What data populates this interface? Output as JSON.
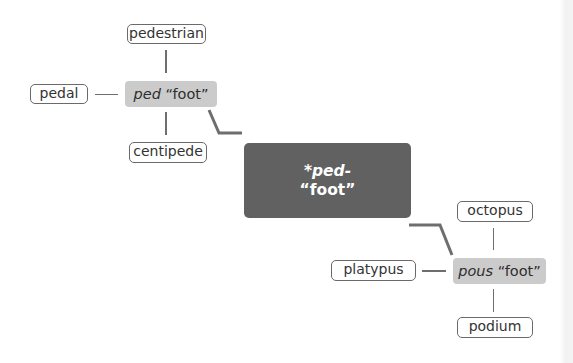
{
  "diagram": {
    "type": "word-family-tree",
    "core": {
      "root": "*ped-",
      "gloss": "“foot”"
    },
    "branches": [
      {
        "root": "ped",
        "gloss": "“foot”",
        "words": {
          "top": "pedestrian",
          "left": "pedal",
          "bottom": "centipede"
        }
      },
      {
        "root": "pous",
        "gloss": "“foot”",
        "words": {
          "top": "octopus",
          "left": "platypus",
          "bottom": "podium"
        }
      }
    ],
    "colors": {
      "core_fill": "#616161",
      "root_fill": "#cbcbcb",
      "line": "#6e6e6e",
      "word_border": "#6a6a6a"
    }
  }
}
